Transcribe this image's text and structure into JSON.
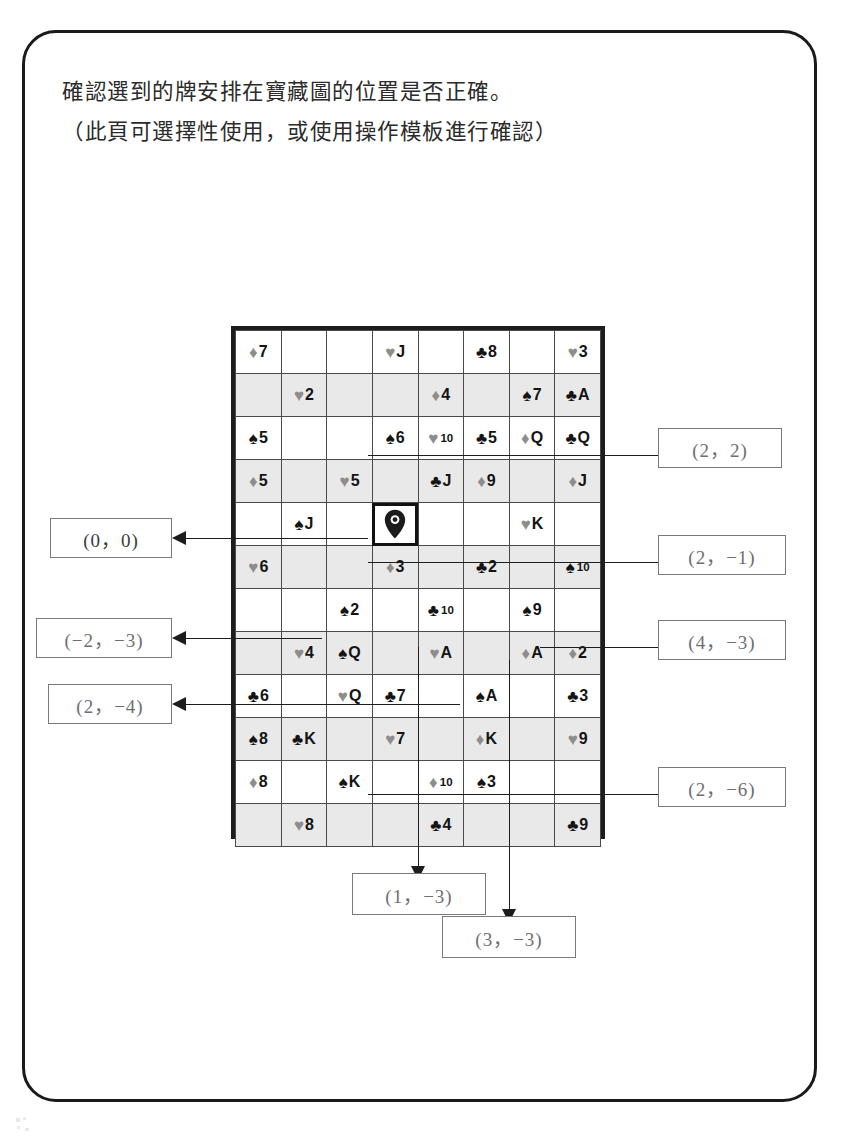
{
  "header": {
    "line1": "確認選到的牌安排在寶藏圖的位置是否正確。",
    "line2": "（此頁可選擇性使用，或使用操作模板進行確認）"
  },
  "legend": {
    "suit_glyphs": {
      "spade": "♠",
      "heart": "♥",
      "club": "♣",
      "diamond": "♦"
    },
    "red_suit_color": "#8d8d8d",
    "black_suit_color": "#141414",
    "shaded_row_color": "#e9e9e9",
    "grid_border_color": "#1d1d1d"
  },
  "grid": {
    "columns": 8,
    "rows": 12,
    "marker_cell": {
      "row": 4,
      "col": 3,
      "icon": "map-pin-icon"
    },
    "cells": [
      [
        {
          "suit": "diamond",
          "rank": "7"
        },
        null,
        null,
        {
          "suit": "heart",
          "rank": "J"
        },
        null,
        {
          "suit": "club",
          "rank": "8"
        },
        null,
        {
          "suit": "heart",
          "rank": "3"
        }
      ],
      [
        null,
        {
          "suit": "heart",
          "rank": "2"
        },
        null,
        null,
        {
          "suit": "diamond",
          "rank": "4"
        },
        null,
        {
          "suit": "spade",
          "rank": "7"
        },
        {
          "suit": "club",
          "rank": "A"
        }
      ],
      [
        {
          "suit": "spade",
          "rank": "5"
        },
        null,
        null,
        {
          "suit": "spade",
          "rank": "6"
        },
        {
          "suit": "heart",
          "rank": "10"
        },
        {
          "suit": "club",
          "rank": "5"
        },
        {
          "suit": "diamond",
          "rank": "Q"
        },
        {
          "suit": "club",
          "rank": "Q"
        }
      ],
      [
        {
          "suit": "diamond",
          "rank": "5"
        },
        null,
        {
          "suit": "heart",
          "rank": "5"
        },
        null,
        {
          "suit": "club",
          "rank": "J"
        },
        {
          "suit": "diamond",
          "rank": "9"
        },
        null,
        {
          "suit": "diamond",
          "rank": "J"
        }
      ],
      [
        null,
        {
          "suit": "spade",
          "rank": "J"
        },
        null,
        {
          "suit": "marker",
          "rank": ""
        },
        null,
        null,
        {
          "suit": "heart",
          "rank": "K"
        },
        null
      ],
      [
        {
          "suit": "heart",
          "rank": "6"
        },
        null,
        null,
        {
          "suit": "diamond",
          "rank": "3"
        },
        null,
        {
          "suit": "club",
          "rank": "2"
        },
        null,
        {
          "suit": "spade",
          "rank": "10"
        }
      ],
      [
        null,
        null,
        {
          "suit": "spade",
          "rank": "2"
        },
        null,
        {
          "suit": "club",
          "rank": "10"
        },
        null,
        {
          "suit": "spade",
          "rank": "9"
        },
        null
      ],
      [
        null,
        {
          "suit": "heart",
          "rank": "4"
        },
        {
          "suit": "spade",
          "rank": "Q"
        },
        null,
        {
          "suit": "heart",
          "rank": "A"
        },
        null,
        {
          "suit": "diamond",
          "rank": "A"
        },
        {
          "suit": "diamond",
          "rank": "2"
        }
      ],
      [
        {
          "suit": "club",
          "rank": "6"
        },
        null,
        {
          "suit": "heart",
          "rank": "Q"
        },
        {
          "suit": "club",
          "rank": "7"
        },
        null,
        {
          "suit": "spade",
          "rank": "A"
        },
        null,
        {
          "suit": "club",
          "rank": "3"
        }
      ],
      [
        {
          "suit": "spade",
          "rank": "8"
        },
        {
          "suit": "club",
          "rank": "K"
        },
        null,
        {
          "suit": "heart",
          "rank": "7"
        },
        null,
        {
          "suit": "diamond",
          "rank": "K"
        },
        null,
        {
          "suit": "heart",
          "rank": "9"
        }
      ],
      [
        {
          "suit": "diamond",
          "rank": "8"
        },
        null,
        {
          "suit": "spade",
          "rank": "K"
        },
        null,
        {
          "suit": "diamond",
          "rank": "10"
        },
        {
          "suit": "spade",
          "rank": "3"
        },
        null,
        null
      ],
      [
        null,
        {
          "suit": "heart",
          "rank": "8"
        },
        null,
        null,
        {
          "suit": "club",
          "rank": "4"
        },
        null,
        null,
        {
          "suit": "club",
          "rank": "9"
        }
      ]
    ],
    "extra_columns_note": "last grid column rendered empty at far right"
  },
  "callouts": {
    "left": [
      {
        "id": "origin",
        "text": "(0，0)",
        "tone": "dark"
      },
      {
        "id": "neg2-neg3",
        "text": "(−2，−3)",
        "tone": "light"
      },
      {
        "id": "2-neg4",
        "text": "(2，−4)",
        "tone": "light"
      }
    ],
    "right": [
      {
        "id": "2-2",
        "text": "(2，2)",
        "tone": "light"
      },
      {
        "id": "2-neg1",
        "text": "(2，−1)",
        "tone": "light"
      },
      {
        "id": "4-neg3",
        "text": "(4，−3)",
        "tone": "light"
      },
      {
        "id": "2-neg6",
        "text": "(2，−6)",
        "tone": "light"
      }
    ],
    "bottom": [
      {
        "id": "1-neg3",
        "text": "(1，−3)",
        "tone": "light"
      },
      {
        "id": "3-neg3",
        "text": "(3，−3)",
        "tone": "light"
      }
    ]
  }
}
